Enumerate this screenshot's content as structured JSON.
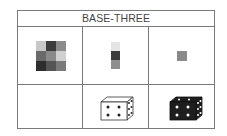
{
  "title": "BASE-THREE",
  "colors": {
    "border": "#7a7a7a",
    "title_text": "#444444"
  },
  "rows": [
    {
      "cells": [
        {
          "type": "3x3-grid",
          "shades": [
            "#c8c8c8",
            "#3c3c3c",
            "#8c8c8c",
            "#6a6a6a",
            "#8a8a8a",
            "#d0d0d0",
            "#2e2e2e",
            "#555555",
            "#7a7a7a"
          ]
        },
        {
          "type": "3x1-column",
          "shades": [
            "#e4e4e4",
            "#3a3a3a",
            "#8e8e8e"
          ]
        },
        {
          "type": "single-square",
          "shades": [
            "#8a8a8a"
          ]
        }
      ]
    },
    {
      "cells": [
        {
          "type": "empty"
        },
        {
          "type": "die",
          "style": "white",
          "front_pips": 4,
          "side_pips": 6
        },
        {
          "type": "die",
          "style": "black",
          "front_pips": 4,
          "side_pips": 6
        }
      ]
    }
  ]
}
